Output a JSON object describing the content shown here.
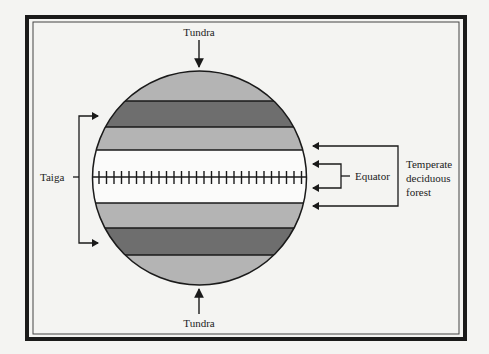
{
  "diagram": {
    "labels": {
      "tundra_top": "Tundra",
      "tundra_bottom": "Tundra",
      "taiga": "Taiga",
      "equator": "Equator",
      "temperate_line1": "Temperate",
      "temperate_line2": "deciduous",
      "temperate_line3": "forest"
    },
    "bands": [
      {
        "name": "tundra-north",
        "color": "#b4b4b4"
      },
      {
        "name": "taiga-north",
        "color": "#6e6e6e"
      },
      {
        "name": "temperate-north",
        "color": "#b4b4b4"
      },
      {
        "name": "equatorial",
        "color": "#fbfbfa"
      },
      {
        "name": "temperate-south",
        "color": "#b4b4b4"
      },
      {
        "name": "taiga-south",
        "color": "#6e6e6e"
      },
      {
        "name": "tundra-south",
        "color": "#b4b4b4"
      }
    ],
    "colors": {
      "stroke": "#1a1a1a",
      "light_band": "#b4b4b4",
      "dark_band": "#6e6e6e",
      "background": "#f4f4f2"
    }
  }
}
